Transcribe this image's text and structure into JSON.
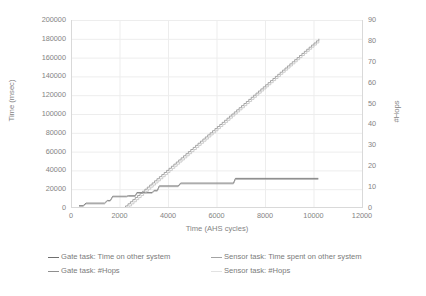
{
  "chart_data": {
    "type": "line",
    "title": "",
    "xlabel": "Time (AHS cycles)",
    "ylabel": "Time (msec)",
    "y2label": "#Hops",
    "xlim": [
      0,
      12000
    ],
    "ylim": [
      0,
      200000
    ],
    "y2lim": [
      0,
      90
    ],
    "xticks": [
      "0",
      "2000",
      "4000",
      "6000",
      "8000",
      "10000",
      "12000"
    ],
    "yticks": [
      "0",
      "20000",
      "40000",
      "60000",
      "80000",
      "100000",
      "120000",
      "140000",
      "160000",
      "180000",
      "200000"
    ],
    "y2ticks": [
      "0",
      "10",
      "20",
      "30",
      "40",
      "50",
      "60",
      "70",
      "80",
      "90"
    ],
    "grid": true,
    "legend_position": "bottom",
    "series": [
      {
        "name": "Gate task: Time on other system",
        "axis": "left",
        "color": "#6f6f6f",
        "style": "step",
        "points": [
          [
            330,
            2500
          ],
          [
            500,
            2500
          ],
          [
            620,
            5200
          ],
          [
            1380,
            5200
          ],
          [
            1500,
            8000
          ],
          [
            1620,
            8000
          ],
          [
            1720,
            12500
          ],
          [
            2290,
            12500
          ],
          [
            2360,
            13000
          ],
          [
            2650,
            13000
          ],
          [
            2720,
            16500
          ],
          [
            3350,
            16500
          ],
          [
            3430,
            18800
          ],
          [
            3560,
            18800
          ],
          [
            3640,
            23500
          ],
          [
            4420,
            23500
          ],
          [
            4520,
            26500
          ],
          [
            6700,
            26500
          ],
          [
            6780,
            31500
          ],
          [
            10200,
            31500
          ]
        ]
      },
      {
        "name": "Sensor task: Time spent on other system",
        "axis": "left",
        "color": "#a6a6a6",
        "style": "step",
        "points": [
          [
            330,
            1800
          ],
          [
            500,
            1800
          ],
          [
            620,
            4400
          ],
          [
            1380,
            4400
          ],
          [
            1500,
            7400
          ],
          [
            1620,
            7400
          ],
          [
            1720,
            11800
          ],
          [
            2290,
            11800
          ],
          [
            2360,
            12400
          ],
          [
            2650,
            12400
          ],
          [
            2720,
            15800
          ],
          [
            3350,
            15800
          ],
          [
            3430,
            18000
          ],
          [
            3560,
            18000
          ],
          [
            3640,
            22700
          ],
          [
            4420,
            22700
          ],
          [
            4520,
            25700
          ],
          [
            6700,
            25700
          ],
          [
            6780,
            30500
          ],
          [
            10200,
            30500
          ]
        ]
      },
      {
        "name": "Gate task: #Hops",
        "axis": "right",
        "color": "#9a9a9a",
        "style": "staircase-linear",
        "points": [
          [
            2150,
            0
          ],
          [
            10220,
            81
          ]
        ]
      },
      {
        "name": "Sensor task: #Hops",
        "axis": "right",
        "color": "#c6c6c6",
        "style": "staircase-linear",
        "points": [
          [
            2300,
            0
          ],
          [
            10220,
            80
          ]
        ]
      }
    ]
  },
  "axes": {
    "y_left_title": "Time (msec)",
    "y_right_title": "#Hops",
    "x_title": "Time (AHS cycles)"
  },
  "legend": {
    "items": [
      {
        "label": "Gate task: Time on other system",
        "color": "#6f6f6f"
      },
      {
        "label": "Sensor task: Time spent on other system",
        "color": "#a3a3a3"
      },
      {
        "label": "Gate task: #Hops",
        "color": "#8f8f8f"
      },
      {
        "label": "Sensor task: #Hops",
        "color": "#e2e2e2"
      }
    ]
  }
}
